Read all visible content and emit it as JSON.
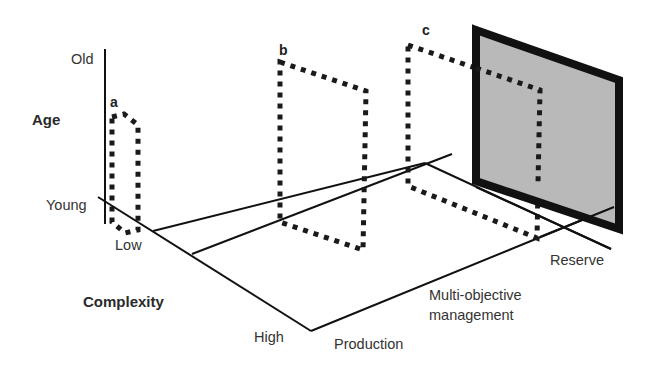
{
  "diagram": {
    "axes": {
      "age": {
        "title": "Age",
        "top_label": "Old",
        "bottom_label": "Young"
      },
      "complexity": {
        "title": "Complexity",
        "start_label": "Low",
        "end_label": "High"
      },
      "management": {
        "labels": [
          "Production",
          "Multi-objective",
          "management",
          "Reserve"
        ]
      }
    },
    "panels": [
      {
        "id": "a",
        "label": "a",
        "style": "dotted"
      },
      {
        "id": "b",
        "label": "b",
        "style": "dotted"
      },
      {
        "id": "c",
        "label": "c",
        "style": "dotted"
      },
      {
        "id": "d",
        "label": "",
        "style": "solid-gray",
        "fill": "#b9b9b9",
        "border": "#111111"
      }
    ],
    "colors": {
      "line": "#111111",
      "text": "#333333",
      "panel_fill": "#b9b9b9",
      "background": "#ffffff"
    }
  }
}
